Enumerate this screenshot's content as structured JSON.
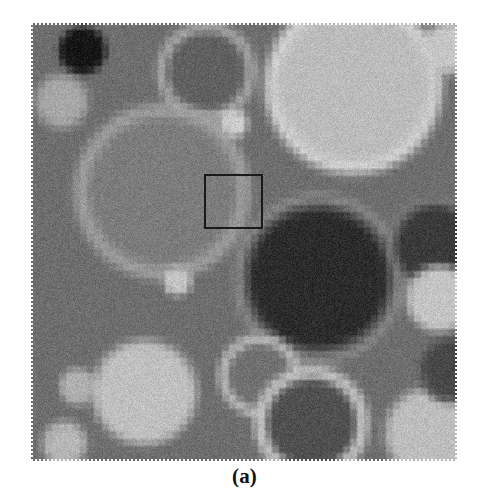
{
  "figure": {
    "caption": "(a)",
    "panel": {
      "x": 31,
      "y": 23,
      "width": 426,
      "height": 438,
      "background_color": "#6e6e6e",
      "grid_cells": 60,
      "noise_amplitude": 26,
      "smoothing_passes": 1
    },
    "roi": {
      "label": "region-of-interest",
      "x": 173,
      "y": 151,
      "width": 59,
      "height": 55,
      "stroke_color": "#1a1a1a",
      "stroke_width": 2
    }
  },
  "chart_data": {
    "type": "heatmap",
    "title": "(a)",
    "xlabel": "",
    "ylabel": "",
    "colormap": "grayscale",
    "value_range": [
      0,
      255
    ],
    "background_level": 110,
    "grid": false,
    "legend": false,
    "annotations": [
      {
        "kind": "rectangle",
        "name": "roi-square",
        "x": 173,
        "y": 151,
        "width": 59,
        "height": 55,
        "color": "#1a1a1a"
      }
    ],
    "blobs": [
      {
        "name": "dark-blob-top-left",
        "cx": 51,
        "cy": 27,
        "r": 24,
        "level": 22,
        "rim_level": 120,
        "rim_width": 3,
        "edge": 4
      },
      {
        "name": "light-patch-upper-left",
        "cx": 30,
        "cy": 78,
        "r": 26,
        "level": 168,
        "rim_level": 168,
        "rim_width": 0,
        "edge": 6
      },
      {
        "name": "ring-blob-top-center",
        "cx": 175,
        "cy": 48,
        "r": 40,
        "level": 96,
        "rim_level": 176,
        "rim_width": 9,
        "edge": 5
      },
      {
        "name": "bright-dot-top-center",
        "cx": 202,
        "cy": 100,
        "r": 14,
        "level": 205,
        "rim_level": 205,
        "rim_width": 0,
        "edge": 3
      },
      {
        "name": "big-bright-circle-top-right",
        "cx": 322,
        "cy": 62,
        "r": 78,
        "level": 188,
        "rim_level": 214,
        "rim_width": 10,
        "edge": 7
      },
      {
        "name": "light-edge-patch-right",
        "cx": 418,
        "cy": 24,
        "r": 26,
        "level": 198,
        "rim_level": 198,
        "rim_width": 0,
        "edge": 6
      },
      {
        "name": "large-gray-circle-center-left",
        "cx": 131,
        "cy": 168,
        "r": 76,
        "level": 124,
        "rim_level": 166,
        "rim_width": 11,
        "edge": 7
      },
      {
        "name": "dark-circle-center-right",
        "cx": 287,
        "cy": 255,
        "r": 74,
        "level": 44,
        "rim_level": 150,
        "rim_width": 7,
        "edge": 9
      },
      {
        "name": "dark-blob-right-edge",
        "cx": 404,
        "cy": 222,
        "r": 41,
        "level": 58,
        "rim_level": 130,
        "rim_width": 5,
        "edge": 6
      },
      {
        "name": "bright-band-right",
        "cx": 408,
        "cy": 275,
        "r": 33,
        "level": 196,
        "rim_level": 196,
        "rim_width": 0,
        "edge": 5
      },
      {
        "name": "bright-square-dot-center",
        "cx": 146,
        "cy": 258,
        "r": 14,
        "level": 196,
        "rim_level": 196,
        "rim_width": 0,
        "edge": 3
      },
      {
        "name": "bright-circle-bottom-left",
        "cx": 113,
        "cy": 369,
        "r": 52,
        "level": 192,
        "rim_level": 192,
        "rim_width": 0,
        "edge": 6
      },
      {
        "name": "small-light-blob-lower-left",
        "cx": 46,
        "cy": 363,
        "r": 18,
        "level": 176,
        "rim_level": 176,
        "rim_width": 0,
        "edge": 4
      },
      {
        "name": "light-bar-lower-left",
        "cx": 33,
        "cy": 420,
        "r": 22,
        "level": 182,
        "rim_level": 182,
        "rim_width": 0,
        "edge": 5
      },
      {
        "name": "ring-small-bottom-center",
        "cx": 228,
        "cy": 352,
        "r": 32,
        "level": 112,
        "rim_level": 190,
        "rim_width": 9,
        "edge": 4
      },
      {
        "name": "ring-large-bottom-center",
        "cx": 280,
        "cy": 400,
        "r": 45,
        "level": 80,
        "rim_level": 198,
        "rim_width": 12,
        "edge": 5
      },
      {
        "name": "bright-band-bottom-right",
        "cx": 400,
        "cy": 410,
        "r": 46,
        "level": 190,
        "rim_level": 190,
        "rim_width": 0,
        "edge": 6
      },
      {
        "name": "dark-patch-bottom-right",
        "cx": 420,
        "cy": 345,
        "r": 30,
        "level": 72,
        "rim_level": 110,
        "rim_width": 4,
        "edge": 5
      }
    ]
  }
}
